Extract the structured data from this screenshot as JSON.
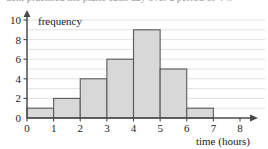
{
  "page": {
    "clipped_top_text": "dent practised the piano each day over a period of 4 w"
  },
  "chart_data": {
    "type": "bar",
    "title": "",
    "subtitle": "",
    "xlabel": "time (hours)",
    "ylabel": "frequency",
    "categories": [
      "0-1",
      "1-2",
      "2-3",
      "3-4",
      "4-5",
      "5-6",
      "6-7",
      "7-8"
    ],
    "bin_edges": [
      0,
      1,
      2,
      3,
      4,
      5,
      6,
      7,
      8
    ],
    "values": [
      1,
      2,
      4,
      6,
      9,
      5,
      1,
      0
    ],
    "xlim": [
      0,
      8
    ],
    "ylim": [
      0,
      10
    ],
    "x_ticks": [
      0,
      1,
      2,
      3,
      4,
      5,
      6,
      7,
      8
    ],
    "x_tick_labels": [
      "0",
      "1",
      "2",
      "3",
      "4",
      "5",
      "6",
      "7",
      "8"
    ],
    "y_ticks": [
      0,
      2,
      4,
      6,
      8,
      10
    ],
    "y_tick_labels": [
      "0",
      "2",
      "4",
      "6",
      "8",
      "10"
    ],
    "y_minor_ticks": [
      1,
      3,
      5,
      7,
      9
    ],
    "grid": true,
    "grid_axis": "y",
    "legend": false,
    "legend_position": "none",
    "colors": {
      "bar_fill": "#d8d8d8",
      "bar_stroke": "#5a5a5a",
      "gridline": "#d5d5d5",
      "axis": "#4a4a4a",
      "text": "#1a1a1a"
    }
  }
}
